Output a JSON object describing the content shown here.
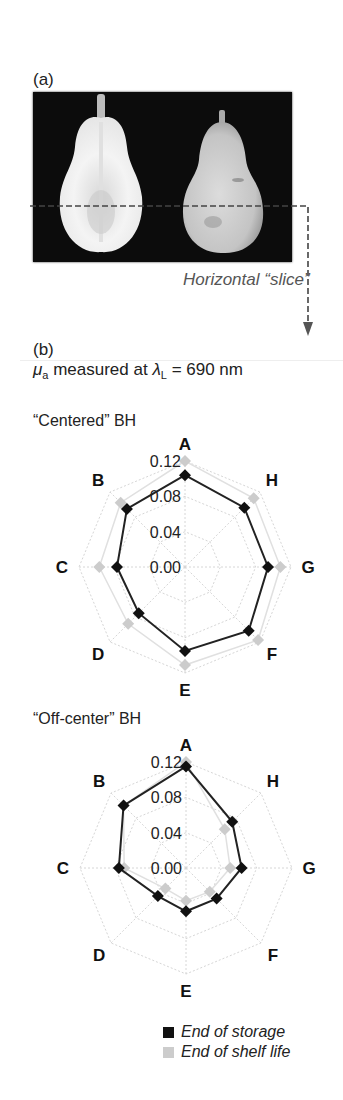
{
  "panel_a": {
    "label": "(a)",
    "slice_label": "Horizontal “slice”"
  },
  "panel_b": {
    "label": "(b)",
    "measure_symbol": "μ",
    "measure_sub": "a",
    "measure_text": " measured at ",
    "lambda_symbol": "λ",
    "lambda_sub": "L",
    "lambda_value": " = 690 nm"
  },
  "legend": {
    "items": [
      {
        "label": "End of storage",
        "color": "#111111"
      },
      {
        "label": "End of shelf life",
        "color": "#cccccc"
      }
    ]
  },
  "chart_data": [
    {
      "type": "radar",
      "title": "“Centered” BH",
      "categories": [
        "A",
        "B",
        "C",
        "D",
        "E",
        "F",
        "G",
        "H"
      ],
      "rlim": [
        0,
        0.12
      ],
      "rticks": [
        "0.00",
        "0.04",
        "0.08",
        "0.12"
      ],
      "series": [
        {
          "name": "End of storage",
          "color": "#111111",
          "values": [
            0.104,
            0.093,
            0.077,
            0.074,
            0.095,
            0.102,
            0.094,
            0.095
          ]
        },
        {
          "name": "End of shelf life",
          "color": "#cccccc",
          "values": [
            0.12,
            0.103,
            0.097,
            0.091,
            0.111,
            0.117,
            0.108,
            0.11
          ]
        }
      ]
    },
    {
      "type": "radar",
      "title": "“Off-center” BH",
      "categories": [
        "A",
        "B",
        "C",
        "D",
        "E",
        "F",
        "G",
        "H"
      ],
      "rlim": [
        0,
        0.12
      ],
      "rticks": [
        "0.00",
        "0.04",
        "0.08",
        "0.12"
      ],
      "series": [
        {
          "name": "End of storage",
          "color": "#111111",
          "values": [
            0.115,
            0.1,
            0.076,
            0.045,
            0.049,
            0.049,
            0.063,
            0.074
          ]
        },
        {
          "name": "End of shelf life",
          "color": "#cccccc",
          "values": [
            0.12,
            0.1,
            0.07,
            0.033,
            0.037,
            0.038,
            0.05,
            0.062
          ]
        }
      ]
    }
  ]
}
